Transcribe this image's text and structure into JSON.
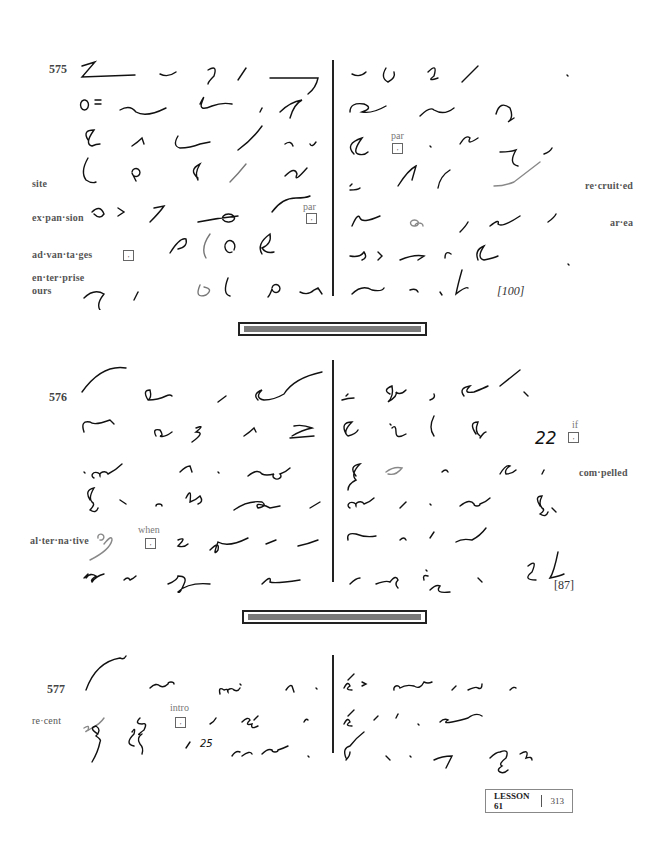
{
  "page": {
    "lesson_label": "LESSON 61",
    "page_number": "313"
  },
  "exercises": [
    {
      "number": "575",
      "word_count": "[100]",
      "margin_words_left": [
        "site",
        "ex·pan·sion",
        "ad·van·ta·ges",
        "en·ter·prise",
        "ours"
      ],
      "margin_words_right": [
        "re·cruit·ed",
        "ar·ea"
      ],
      "notes": [
        {
          "label": "par",
          "mark": ","
        },
        {
          "label": "par",
          "mark": ","
        },
        {
          "label": "",
          "mark": ","
        }
      ]
    },
    {
      "number": "576",
      "word_count": "[87]",
      "margin_words_left": [
        "al·ter·na·tive"
      ],
      "margin_words_right": [
        "com·pelled"
      ],
      "inline_number": "22",
      "notes": [
        {
          "label": "when",
          "mark": ","
        },
        {
          "label": "if",
          "mark": ","
        }
      ]
    },
    {
      "number": "577",
      "margin_words_left": [
        "re·cent"
      ],
      "inline_number": "25",
      "notes": [
        {
          "label": "intro",
          "mark": ","
        }
      ]
    }
  ]
}
